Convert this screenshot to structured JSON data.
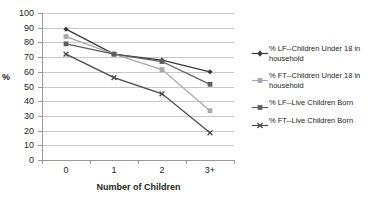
{
  "chart_data": {
    "type": "line",
    "title": "",
    "xlabel": "Number of Children",
    "ylabel": "%",
    "categories": [
      "0",
      "1",
      "2",
      "3+"
    ],
    "ylim": [
      0,
      100
    ],
    "ytick_step": 10,
    "yticks": [
      "100",
      "90",
      "80",
      "70",
      "60",
      "50",
      "40",
      "30",
      "20",
      "10",
      "0"
    ],
    "grid": true,
    "legend_position": "right",
    "series": [
      {
        "name": "% LF--Children Under 18 in household",
        "marker": "diamond",
        "color": "#3a3a3a",
        "values": [
          89,
          72,
          68,
          60
        ]
      },
      {
        "name": "% FT--Children Under 18 in household",
        "marker": "square",
        "color": "#a8a8a8",
        "values": [
          84,
          72,
          61.5,
          33.5
        ]
      },
      {
        "name": "% LF--Live Children Born",
        "marker": "square",
        "color": "#5e5e5e",
        "values": [
          79,
          72,
          67,
          51.5
        ]
      },
      {
        "name": "% FT--Live Children Born",
        "marker": "x",
        "color": "#4a4a4a",
        "values": [
          72,
          56,
          45,
          18.5
        ]
      }
    ]
  },
  "legend": {
    "items": [
      {
        "label": "% LF--Children Under 18 in household"
      },
      {
        "label": "% FT--Children Under 18 in household"
      },
      {
        "label": "% LF--Live Children Born"
      },
      {
        "label": "% FT--Live Children Born"
      }
    ]
  }
}
